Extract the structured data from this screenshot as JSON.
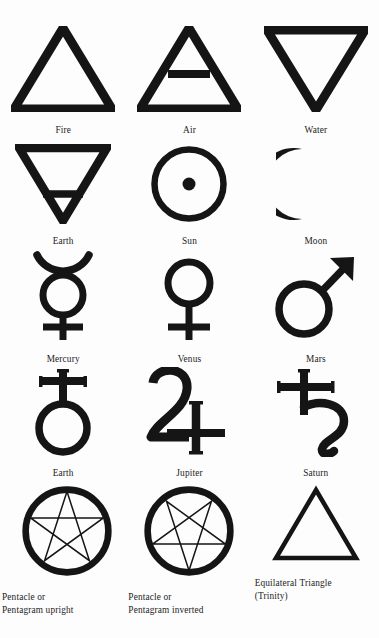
{
  "page": {
    "background_color": "#fdfdfd",
    "ink_color": "#151515",
    "columns": 3,
    "rows": 5
  },
  "symbols": [
    {
      "id": "fire",
      "icon": "upward-triangle-icon",
      "label": "Fire",
      "row": 1,
      "column": 1
    },
    {
      "id": "air",
      "icon": "upward-triangle-with-bar-icon",
      "label": "Air",
      "row": 1,
      "column": 2
    },
    {
      "id": "water",
      "icon": "downward-triangle-icon",
      "label": "Water",
      "row": 1,
      "column": 3
    },
    {
      "id": "earth-element",
      "icon": "downward-triangle-with-bar-icon",
      "label": "Earth",
      "row": 2,
      "column": 1
    },
    {
      "id": "sun",
      "icon": "circle-with-center-dot-icon",
      "label": "Sun",
      "row": 2,
      "column": 2
    },
    {
      "id": "moon",
      "icon": "crescent-moon-icon",
      "label": "Moon",
      "row": 2,
      "column": 3
    },
    {
      "id": "mercury",
      "icon": "mercury-icon",
      "label": "Mercury",
      "row": 3,
      "column": 1
    },
    {
      "id": "venus",
      "icon": "venus-icon",
      "label": "Venus",
      "row": 3,
      "column": 2
    },
    {
      "id": "mars",
      "icon": "mars-icon",
      "label": "Mars",
      "row": 3,
      "column": 3
    },
    {
      "id": "earth-planet",
      "icon": "earth-planet-icon",
      "label": "Earth",
      "row": 4,
      "column": 1
    },
    {
      "id": "jupiter",
      "icon": "jupiter-icon",
      "label": "Jupiter",
      "row": 4,
      "column": 2
    },
    {
      "id": "saturn",
      "icon": "saturn-icon",
      "label": "Saturn",
      "row": 4,
      "column": 3
    },
    {
      "id": "pentacle-upright",
      "icon": "pentagram-upright-in-circle-icon",
      "label": "Pentacle or\nPentagram upright",
      "row": 5,
      "column": 1
    },
    {
      "id": "pentacle-inverted",
      "icon": "pentagram-inverted-in-circle-icon",
      "label": "Pentacle or\nPentagram inverted",
      "row": 5,
      "column": 2
    },
    {
      "id": "equilateral-triangle",
      "icon": "thin-upward-triangle-icon",
      "label": "Equilateral Triangle\n(Trinity)",
      "row": 5,
      "column": 3
    }
  ]
}
